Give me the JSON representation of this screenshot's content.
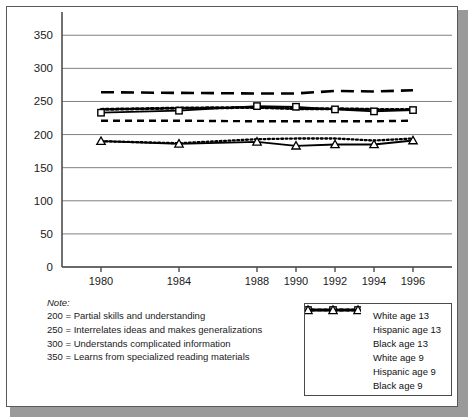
{
  "chart_data": {
    "type": "line",
    "title": "",
    "xlabel": "",
    "ylabel": "",
    "x": [
      1980,
      1984,
      1988,
      1990,
      1992,
      1994,
      1996
    ],
    "categories": [
      "1980",
      "1984",
      "1988",
      "1990",
      "1992",
      "1994",
      "1996"
    ],
    "xlim": [
      1978,
      1998
    ],
    "ylim": [
      0,
      370
    ],
    "yticks": [
      0,
      50,
      100,
      150,
      200,
      250,
      300,
      350
    ],
    "ytick_labels": [
      "0",
      "50",
      "100",
      "150",
      "200",
      "250",
      "300",
      "350"
    ],
    "grid": true,
    "legend_position": "bottom-right",
    "series": [
      {
        "name": "White age 13",
        "style": "long-dash",
        "marker": "none",
        "values": [
          264,
          263,
          262,
          262,
          266,
          265,
          267
        ]
      },
      {
        "name": "Hispanic age 13",
        "style": "thick-dotted",
        "marker": "none",
        "values": [
          238,
          240,
          241,
          239,
          239,
          238,
          238
        ]
      },
      {
        "name": "Black age 13",
        "style": "solid",
        "marker": "square",
        "values": [
          233,
          236,
          243,
          242,
          238,
          235,
          237
        ]
      },
      {
        "name": "White age 9",
        "style": "short-dash",
        "marker": "none",
        "values": [
          221,
          221,
          220,
          220,
          220,
          220,
          221
        ]
      },
      {
        "name": "Hispanic age 9",
        "style": "fine-dotted",
        "marker": "none",
        "values": [
          190,
          187,
          193,
          194,
          194,
          191,
          194
        ]
      },
      {
        "name": "Black age 9",
        "style": "solid",
        "marker": "triangle",
        "values": [
          190,
          186,
          189,
          183,
          185,
          185,
          191
        ]
      }
    ]
  },
  "note": {
    "title": "Note:",
    "lines": [
      "200 = Partial skills and understanding",
      "250 = Interrelates ideas and makes generalizations",
      "300 = Understands complicated information",
      "350 = Learns from specialized reading materials"
    ]
  },
  "legend": {
    "items": [
      {
        "label": "White age 13",
        "sample": "long-dash"
      },
      {
        "label": "Hispanic age 13",
        "sample": "thick-dotted"
      },
      {
        "label": "Black age 13",
        "sample": "square-solid"
      },
      {
        "label": "White age 9",
        "sample": "short-dash"
      },
      {
        "label": "Hispanic age 9",
        "sample": "fine-dotted"
      },
      {
        "label": "Black age 9",
        "sample": "triangle-solid"
      }
    ]
  },
  "colors": {
    "line": "#000000",
    "grid": "#808080",
    "axis": "#4d4d4d",
    "text": "#1a1a1a",
    "panel_border": "#59595b",
    "shadow": "#9a9a9a"
  }
}
